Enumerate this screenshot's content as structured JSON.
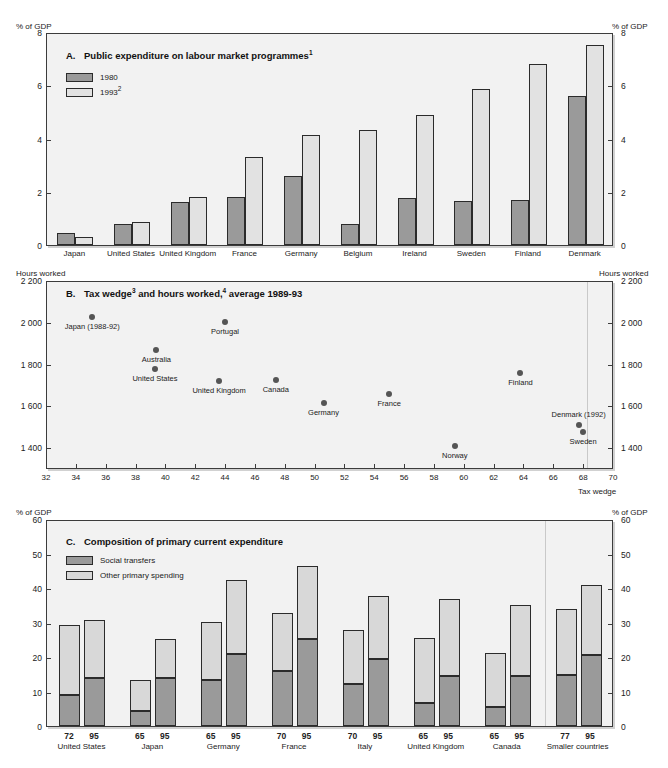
{
  "figure": {
    "top_title_clipped": "",
    "background": "#ffffff"
  },
  "colors": {
    "series_1980": "#9a9a9a",
    "series_1993": "#e2e2e2",
    "social_transfers": "#9a9a9a",
    "other_primary_spending": "#d8d8d8",
    "dot": "#555555",
    "plot_background": "#f2f2f2",
    "axis": "#3c3c3c"
  },
  "panel_a": {
    "letter": "A.",
    "title": "Public expenditure on labour market programmes",
    "title_sup": "1",
    "unit_left": "% of GDP",
    "unit_right": "% of GDP",
    "legend": [
      {
        "label": "1980",
        "sup": "",
        "swatch": "series_1980"
      },
      {
        "label": "1993",
        "sup": "2",
        "swatch": "series_1993"
      }
    ],
    "yticks": [
      "8",
      "6",
      "4",
      "2",
      "0"
    ],
    "chart_data": {
      "type": "bar",
      "title": "A. Public expenditure on labour market programmes",
      "ylabel": "% of GDP",
      "xlabel": "",
      "ylim": [
        0,
        8
      ],
      "grid": false,
      "legend_position": "top-left",
      "categories": [
        "Japan",
        "United States",
        "United Kingdom",
        "France",
        "Germany",
        "Belgium",
        "Ireland",
        "Sweden",
        "Finland",
        "Denmark"
      ],
      "series": [
        {
          "name": "1980",
          "values": [
            0.45,
            0.78,
            1.62,
            1.8,
            2.58,
            0.78,
            1.75,
            1.65,
            1.7,
            5.6
          ]
        },
        {
          "name": "1993",
          "values": [
            0.3,
            0.85,
            1.8,
            3.32,
            4.12,
            4.33,
            4.88,
            5.85,
            6.78,
            7.5
          ]
        }
      ]
    }
  },
  "panel_b": {
    "letter": "B.",
    "title_part1": "Tax wedge",
    "title_sup1": "3",
    "title_part2": " and hours worked,",
    "title_sup2": "4",
    "title_part3": " average 1989-93",
    "unit_left": "Hours worked",
    "unit_right": "Hours worked",
    "xaxis_caption": "Tax wedge",
    "yticks": [
      "2 200",
      "2 000",
      "1 800",
      "1 600",
      "1 400"
    ],
    "xticks": [
      "32",
      "34",
      "36",
      "38",
      "40",
      "42",
      "44",
      "46",
      "48",
      "50",
      "52",
      "54",
      "56",
      "58",
      "60",
      "62",
      "64",
      "66",
      "68",
      "70"
    ],
    "chart_data": {
      "type": "scatter",
      "title": "B. Tax wedge and hours worked, average 1989-93",
      "xlabel": "Tax wedge",
      "ylabel": "Hours worked",
      "xlim": [
        32,
        70
      ],
      "ylim": [
        1300,
        2200
      ],
      "grid": false,
      "points": [
        {
          "label": "Japan (1988-92)",
          "x": 35.1,
          "y": 2030,
          "label_pos": "below"
        },
        {
          "label": "Portugal",
          "x": 44.0,
          "y": 2005,
          "label_pos": "below"
        },
        {
          "label": "Australia",
          "x": 39.4,
          "y": 1872,
          "label_pos": "below"
        },
        {
          "label": "United States",
          "x": 39.3,
          "y": 1780,
          "label_pos": "below"
        },
        {
          "label": "United Kingdom",
          "x": 43.6,
          "y": 1722,
          "label_pos": "below"
        },
        {
          "label": "Canada",
          "x": 47.4,
          "y": 1726,
          "label_pos": "below"
        },
        {
          "label": "Germany",
          "x": 50.6,
          "y": 1617,
          "label_pos": "below"
        },
        {
          "label": "France",
          "x": 55.0,
          "y": 1658,
          "label_pos": "below"
        },
        {
          "label": "Finland",
          "x": 63.8,
          "y": 1758,
          "label_pos": "below"
        },
        {
          "label": "Denmark (1992)",
          "x": 67.7,
          "y": 1510,
          "label_pos": "above"
        },
        {
          "label": "Sweden",
          "x": 68.0,
          "y": 1478,
          "label_pos": "below"
        },
        {
          "label": "Norway",
          "x": 59.4,
          "y": 1412,
          "label_pos": "below"
        }
      ]
    }
  },
  "panel_c": {
    "letter": "C.",
    "title": "Composition of primary current expenditure",
    "unit_left": "% of GDP",
    "unit_right": "% of GDP",
    "legend": [
      {
        "label": "Social transfers",
        "swatch": "social_transfers"
      },
      {
        "label": "Other primary spending",
        "swatch": "other_primary_spending"
      }
    ],
    "yticks": [
      "60",
      "50",
      "40",
      "30",
      "20",
      "10",
      "0"
    ],
    "chart_data": {
      "type": "bar",
      "stacked": true,
      "title": "C. Composition of primary current expenditure",
      "ylabel": "% of GDP",
      "xlabel": "",
      "ylim": [
        0,
        60
      ],
      "grid": false,
      "legend_position": "top-left",
      "groups": [
        {
          "country": "United States",
          "bars": [
            {
              "year": "72",
              "social_transfers": 8.9,
              "total": 29.2
            },
            {
              "year": "95",
              "social_transfers": 14.0,
              "total": 30.8
            }
          ]
        },
        {
          "country": "Japan",
          "bars": [
            {
              "year": "65",
              "social_transfers": 4.4,
              "total": 13.2
            },
            {
              "year": "95",
              "social_transfers": 14.0,
              "total": 25.1
            }
          ]
        },
        {
          "country": "Germany",
          "bars": [
            {
              "year": "65",
              "social_transfers": 13.2,
              "total": 30.1
            },
            {
              "year": "95",
              "social_transfers": 20.8,
              "total": 42.4
            }
          ]
        },
        {
          "country": "France",
          "bars": [
            {
              "year": "70",
              "social_transfers": 16.0,
              "total": 32.9
            },
            {
              "year": "95",
              "social_transfers": 25.2,
              "total": 46.5
            }
          ]
        },
        {
          "country": "Italy",
          "bars": [
            {
              "year": "70",
              "social_transfers": 12.3,
              "total": 27.8
            },
            {
              "year": "95",
              "social_transfers": 19.5,
              "total": 37.6
            }
          ]
        },
        {
          "country": "United Kingdom",
          "bars": [
            {
              "year": "65",
              "social_transfers": 6.7,
              "total": 25.4
            },
            {
              "year": "95",
              "social_transfers": 14.4,
              "total": 36.7
            }
          ]
        },
        {
          "country": "Canada",
          "bars": [
            {
              "year": "65",
              "social_transfers": 5.5,
              "total": 21.2
            },
            {
              "year": "95",
              "social_transfers": 14.5,
              "total": 35.2
            }
          ]
        },
        {
          "country": "Smaller countries",
          "bars": [
            {
              "year": "77",
              "social_transfers": 14.7,
              "total": 34.0
            },
            {
              "year": "95",
              "social_transfers": 20.5,
              "total": 40.8
            }
          ]
        }
      ]
    }
  }
}
